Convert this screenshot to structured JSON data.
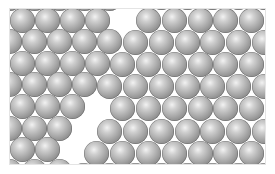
{
  "figure": {
    "colors": {
      "background": "#ffffff",
      "frame_border": "#e4e4e4",
      "sphere_highlight": "#f2f2f2",
      "sphere_mid": "#a6a6a6",
      "sphere_shadow": "#6a6a6a"
    },
    "frame": {
      "x": 10,
      "y": 9,
      "width": 255,
      "height": 155
    },
    "sphere_diameter": 25,
    "grains": [
      {
        "name": "left-grain",
        "pitch": 25,
        "row_spacing": 21.6,
        "origin_x": 22,
        "origin_y": 20,
        "rows": 8
      },
      {
        "name": "right-grain",
        "pitch": 25.8,
        "row_spacing": 22.2,
        "origin_x": 200,
        "origin_y": 20,
        "rows": 8
      }
    ],
    "boundary": {
      "top": [
        128,
        9
      ],
      "bottom": [
        72,
        164
      ]
    }
  }
}
